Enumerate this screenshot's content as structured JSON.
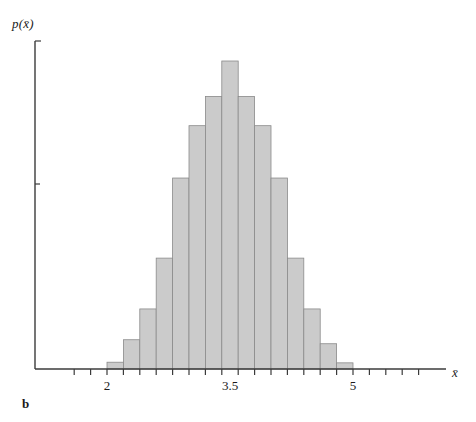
{
  "figure": {
    "panel_label": "b",
    "y_axis_label": "p(x̄)",
    "x_axis_label": "x̄"
  },
  "chart_data": {
    "type": "bar",
    "title": "",
    "subtitle": "",
    "xlabel": "x̄",
    "ylabel": "p(x̄)",
    "grid": false,
    "legend": null,
    "bin_width": 0.2,
    "xlim": [
      1.45,
      6.0
    ],
    "ylim": [
      0,
      1.0
    ],
    "x_tick_labels": [
      "2",
      "3.5",
      "5"
    ],
    "x_tick_values": [
      2,
      3.5,
      5
    ],
    "x_minor_tick_values": [
      1.6,
      1.8,
      2.0,
      2.2,
      2.4,
      2.6,
      2.8,
      3.0,
      3.2,
      3.4,
      3.6,
      3.8,
      4.0,
      4.2,
      4.4,
      4.6,
      4.8,
      5.0,
      5.2,
      5.4,
      5.6,
      5.8
    ],
    "y_tick_values": [],
    "y_tick_labels": [],
    "bin_left_edges": [
      2.0,
      2.2,
      2.4,
      2.6,
      2.8,
      3.0,
      3.2,
      3.4,
      3.6,
      3.8,
      4.0,
      4.2,
      4.4,
      4.6,
      4.8
    ],
    "bin_centers": [
      2.1,
      2.3,
      2.5,
      2.7,
      2.9,
      3.1,
      3.3,
      3.5,
      3.7,
      3.9,
      4.1,
      4.3,
      4.5,
      4.7,
      4.9
    ],
    "categories": [
      "2.0-2.2",
      "2.2-2.4",
      "2.4-2.6",
      "2.6-2.8",
      "2.8-3.0",
      "3.0-3.2",
      "3.2-3.4",
      "3.4-3.6",
      "3.6-3.8",
      "3.8-4.0",
      "4.0-4.2",
      "4.2-4.4",
      "4.4-4.6",
      "4.6-4.8",
      "4.8-5.0"
    ],
    "values": [
      0.022,
      0.095,
      0.195,
      0.36,
      0.62,
      0.79,
      0.885,
      1.0,
      0.885,
      0.79,
      0.62,
      0.36,
      0.195,
      0.082,
      0.02
    ]
  },
  "geometry": {
    "axis_origin_x": 35,
    "axis_baseline_y": 369,
    "axis_top_y": 41,
    "axis_right_x": 446,
    "x_pixel_at_2": 107,
    "x_pixel_at_3_5": 230,
    "x_pixel_at_5": 353,
    "bar_plot_top_y": 61
  },
  "colors": {
    "bar_fill": "#cbcbcb",
    "bar_stroke": "#8a8a8a",
    "axis": "#3b3b3b",
    "text": "#1a1a1a",
    "background": "#ffffff"
  }
}
